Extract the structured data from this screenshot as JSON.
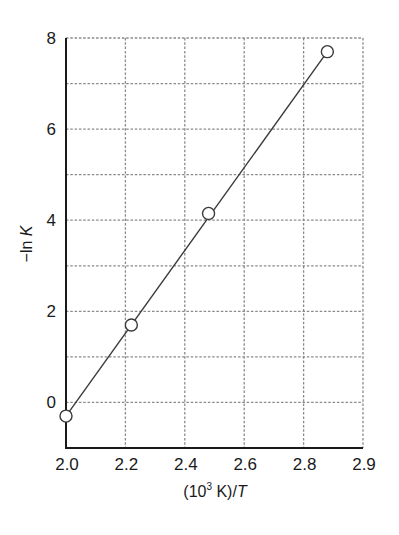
{
  "chart_data": {
    "type": "line",
    "title": "",
    "xlabel": "(10^3 K)/T",
    "xlabel_parts": {
      "prefix": "(10",
      "sup": "3",
      "middle": " K)/",
      "italic": "T"
    },
    "ylabel": "−ln K",
    "ylabel_parts": {
      "prefix": "−ln ",
      "italic": "K"
    },
    "x_ticks": [
      "2.0",
      "2.2",
      "2.4",
      "2.6",
      "2.8",
      "2.9"
    ],
    "y_ticks": [
      "0",
      "2",
      "4",
      "6",
      "8"
    ],
    "xlim": [
      2.0,
      2.9
    ],
    "ylim": [
      -1,
      8
    ],
    "grid": true,
    "grid_style": "dotted",
    "legend": null,
    "series": [
      {
        "name": "−ln K vs 1/T",
        "marker": "open-circle",
        "line": "linear-fit",
        "x": [
          2.0,
          2.22,
          2.48,
          2.88
        ],
        "y": [
          -0.3,
          1.7,
          4.15,
          7.7
        ]
      }
    ]
  },
  "style": {
    "axis_color": "#1a1a1a",
    "grid_color": "#8a8a8a",
    "line_color": "#3a3a3a",
    "marker_fill": "#ffffff",
    "marker_stroke": "#3a3a3a"
  }
}
